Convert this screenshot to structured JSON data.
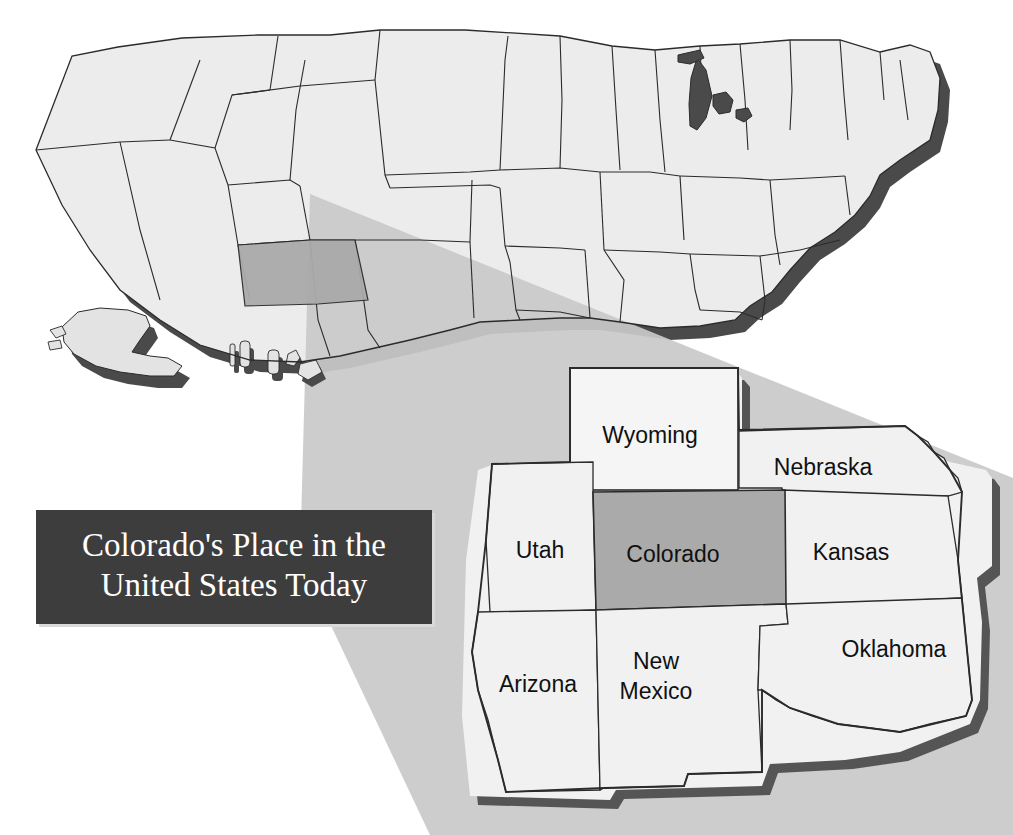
{
  "document": {
    "kind": "map-figure",
    "background_color": "#ffffff"
  },
  "title_box": {
    "line1": "Colorado's Place in the",
    "line2": "United States Today",
    "background_color": "#3d3d3d",
    "text_color": "#ffffff"
  },
  "palette": {
    "state_fill": "#ececed",
    "state_fill_alt": "#e3e3e4",
    "highlight_fill": "#aaaaaa",
    "shadow_fill": "#4a4a4a",
    "lake_fill": "#4a4a4a",
    "outline": "#2b2b2b",
    "spotlight_fill": "#c9c9c9",
    "inset_fill": "#f1f1f1",
    "inset_highlight_fill": "#aaaaaa",
    "inset_shadow": "#555555"
  },
  "main_map": {
    "name": "United States",
    "highlighted_state": "Colorado",
    "includes_alaska": true,
    "includes_hawaii": true,
    "has_spotlight_cone": true
  },
  "inset_map": {
    "name": "Colorado and neighboring states",
    "highlighted_state": "Colorado",
    "states": [
      {
        "id": "wyoming",
        "label": "Wyoming",
        "label_x": 650,
        "label_y": 437,
        "highlighted": false
      },
      {
        "id": "nebraska",
        "label": "Nebraska",
        "label_x": 823,
        "label_y": 469,
        "highlighted": false
      },
      {
        "id": "utah",
        "label": "Utah",
        "label_x": 540,
        "label_y": 552,
        "highlighted": false
      },
      {
        "id": "colorado",
        "label": "Colorado",
        "label_x": 673,
        "label_y": 556,
        "highlighted": true
      },
      {
        "id": "kansas",
        "label": "Kansas",
        "label_x": 851,
        "label_y": 554,
        "highlighted": false
      },
      {
        "id": "arizona",
        "label": "Arizona",
        "label_x": 538,
        "label_y": 686,
        "highlighted": false
      },
      {
        "id": "new-mexico",
        "label": "New",
        "label2": "Mexico",
        "label_x": 656,
        "label_y": 663,
        "highlighted": false
      },
      {
        "id": "oklahoma",
        "label": "Oklahoma",
        "label_x": 894,
        "label_y": 651,
        "highlighted": false
      }
    ]
  }
}
